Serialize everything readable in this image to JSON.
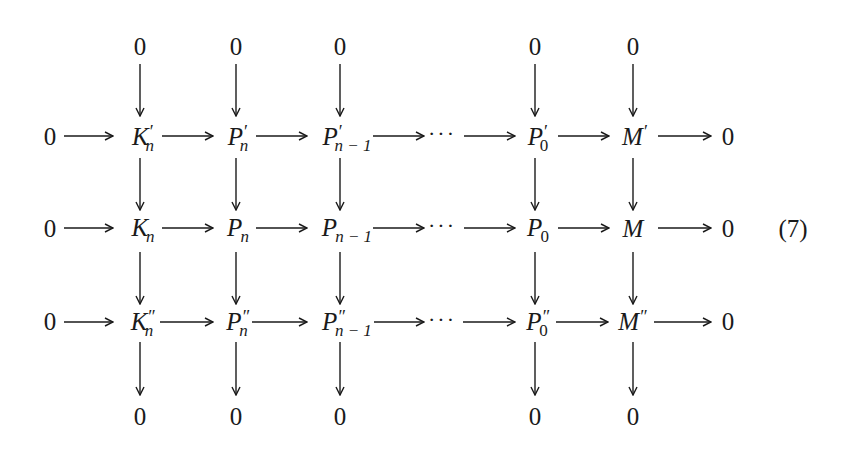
{
  "diagram": {
    "type": "commutative-diagram",
    "equation_number": "(7)",
    "dots": "···",
    "top_zeros": [
      "0",
      "0",
      "0",
      "0",
      "0"
    ],
    "bottom_zeros": [
      "0",
      "0",
      "0",
      "0",
      "0"
    ],
    "rows": [
      {
        "left": "0",
        "right": "0",
        "nodes": [
          {
            "base": "K",
            "sup": "′",
            "sub": "n"
          },
          {
            "base": "P",
            "sup": "′",
            "sub": "n"
          },
          {
            "base": "P",
            "sup": "′",
            "sub": "n − 1"
          },
          {
            "base": "P",
            "sup": "′",
            "sub": "0"
          },
          {
            "base": "M",
            "sup": "′",
            "sub": ""
          }
        ]
      },
      {
        "left": "0",
        "right": "0",
        "nodes": [
          {
            "base": "K",
            "sup": "",
            "sub": "n"
          },
          {
            "base": "P",
            "sup": "",
            "sub": "n"
          },
          {
            "base": "P",
            "sup": "",
            "sub": "n − 1"
          },
          {
            "base": "P",
            "sup": "",
            "sub": "0"
          },
          {
            "base": "M",
            "sup": "",
            "sub": ""
          }
        ]
      },
      {
        "left": "0",
        "right": "0",
        "nodes": [
          {
            "base": "K",
            "sup": "″",
            "sub": "n"
          },
          {
            "base": "P",
            "sup": "″",
            "sub": "n"
          },
          {
            "base": "P",
            "sup": "″",
            "sub": "n − 1"
          },
          {
            "base": "P",
            "sup": "″",
            "sub": "0"
          },
          {
            "base": "M",
            "sup": "″",
            "sub": ""
          }
        ]
      }
    ]
  }
}
